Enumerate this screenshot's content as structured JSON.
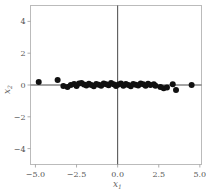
{
  "chart_data": {
    "type": "scatter",
    "title": "",
    "xlabel": "x1",
    "ylabel": "x2",
    "xlabel_main": "x",
    "xlabel_sub": "1",
    "ylabel_main": "x",
    "ylabel_sub": "2",
    "xlim": [
      -5.3,
      5.1
    ],
    "ylim": [
      -5.0,
      5.0
    ],
    "xticks": [
      -5.0,
      -2.5,
      0.0,
      2.5,
      5.0
    ],
    "xtick_labels": [
      "−5.0",
      "−2.5",
      "0.0",
      "2.5",
      "5.0"
    ],
    "yticks": [
      -4,
      -2,
      0,
      2,
      4
    ],
    "ytick_labels": [
      "−4",
      "−2",
      "0",
      "2",
      "4"
    ],
    "grid": false,
    "reference_lines": {
      "x": 0,
      "y": 0
    },
    "marker_color": "#111111",
    "axis_line_color": "#333333",
    "frame_color": "#bbbbbb",
    "points": [
      {
        "x": -4.8,
        "y": 0.19
      },
      {
        "x": -3.65,
        "y": 0.32
      },
      {
        "x": -3.3,
        "y": -0.06
      },
      {
        "x": -3.05,
        "y": -0.13
      },
      {
        "x": -2.85,
        "y": 0.0
      },
      {
        "x": -2.65,
        "y": 0.06
      },
      {
        "x": -2.5,
        "y": -0.06
      },
      {
        "x": -2.35,
        "y": 0.1
      },
      {
        "x": -2.2,
        "y": 0.13
      },
      {
        "x": -2.05,
        "y": 0.03
      },
      {
        "x": -1.9,
        "y": -0.03
      },
      {
        "x": -1.75,
        "y": 0.08
      },
      {
        "x": -1.6,
        "y": 0.0
      },
      {
        "x": -1.45,
        "y": -0.08
      },
      {
        "x": -1.3,
        "y": 0.06
      },
      {
        "x": -1.15,
        "y": 0.02
      },
      {
        "x": -1.0,
        "y": -0.05
      },
      {
        "x": -0.85,
        "y": 0.1
      },
      {
        "x": -0.7,
        "y": 0.04
      },
      {
        "x": -0.55,
        "y": -0.02
      },
      {
        "x": -0.4,
        "y": 0.12
      },
      {
        "x": -0.25,
        "y": 0.05
      },
      {
        "x": -0.1,
        "y": -0.06
      },
      {
        "x": 0.05,
        "y": 0.03
      },
      {
        "x": 0.2,
        "y": 0.09
      },
      {
        "x": 0.35,
        "y": -0.04
      },
      {
        "x": 0.5,
        "y": 0.06
      },
      {
        "x": 0.65,
        "y": 0.0
      },
      {
        "x": 0.8,
        "y": -0.08
      },
      {
        "x": 0.95,
        "y": 0.07
      },
      {
        "x": 1.1,
        "y": 0.02
      },
      {
        "x": 1.25,
        "y": -0.03
      },
      {
        "x": 1.4,
        "y": 0.1
      },
      {
        "x": 1.55,
        "y": 0.04
      },
      {
        "x": 1.7,
        "y": -0.05
      },
      {
        "x": 1.85,
        "y": 0.08
      },
      {
        "x": 2.0,
        "y": 0.0
      },
      {
        "x": 2.2,
        "y": 0.05
      },
      {
        "x": 2.3,
        "y": -0.05
      },
      {
        "x": 2.6,
        "y": -0.12
      },
      {
        "x": 2.8,
        "y": -0.2
      },
      {
        "x": 3.0,
        "y": -0.15
      },
      {
        "x": 3.35,
        "y": 0.05
      },
      {
        "x": 3.55,
        "y": -0.32
      },
      {
        "x": 4.5,
        "y": 0.0
      }
    ]
  }
}
